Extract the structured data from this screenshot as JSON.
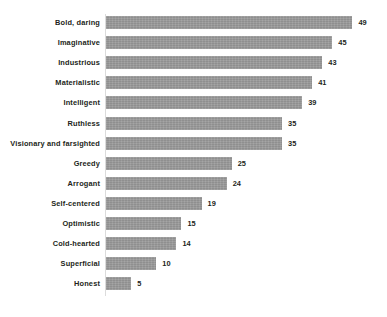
{
  "chart_data": {
    "type": "bar",
    "orientation": "horizontal",
    "title": "",
    "subtitle": "",
    "xlabel": "",
    "ylabel": "",
    "grid": false,
    "legend": null,
    "xlim": [
      0,
      49
    ],
    "show_value_labels": true,
    "bar_color": "#9b9b9b",
    "text_color": "#231f20",
    "axis_color": "#dcdcdc",
    "background_color": "#ffffff",
    "categories": [
      "Bold, daring",
      "Imaginative",
      "Industrious",
      "Materialistic",
      "Intelligent",
      "Ruthless",
      "Visionary and farsighted",
      "Greedy",
      "Arrogant",
      "Self-centered",
      "Optimistic",
      "Cold-hearted",
      "Superficial",
      "Honest"
    ],
    "values": [
      49,
      45,
      43,
      41,
      39,
      35,
      35,
      25,
      24,
      19,
      15,
      14,
      10,
      5
    ],
    "value_labels": [
      "49",
      "45",
      "43",
      "41",
      "39",
      "35",
      "35",
      "25",
      "24",
      "19",
      "15",
      "14",
      "10",
      "5"
    ]
  }
}
